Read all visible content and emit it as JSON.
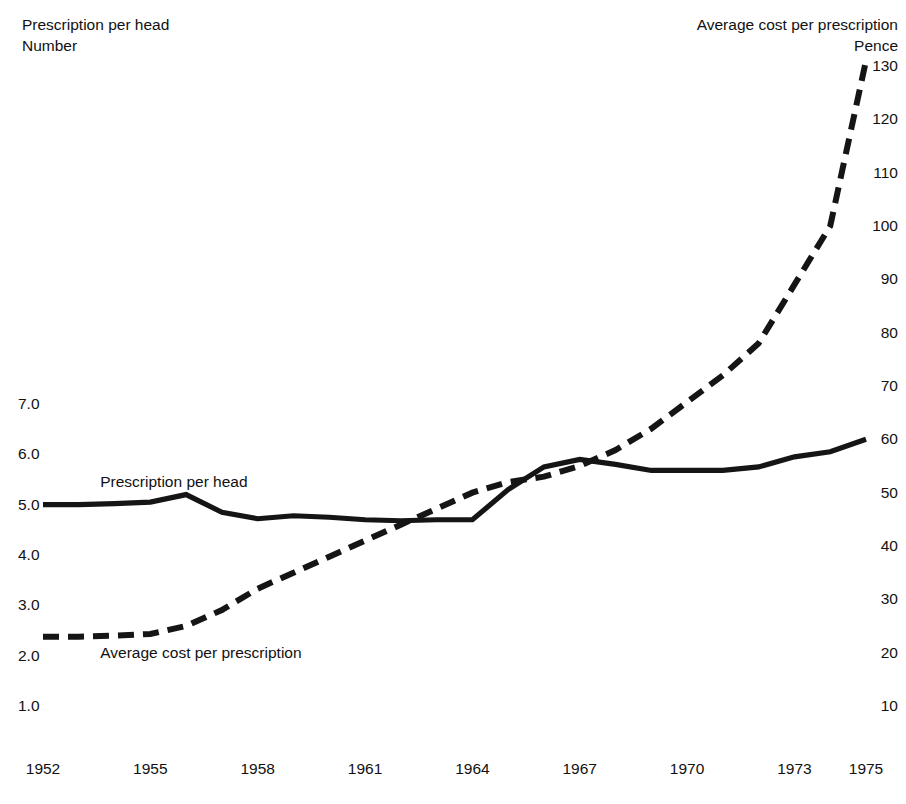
{
  "header": {
    "left_line1": "Prescription per head",
    "left_line2": "Number",
    "right_line1": "Average cost per prescription",
    "right_line2": "Pence"
  },
  "series_labels": {
    "solid": "Prescription per head",
    "dashed": "Average cost per prescription"
  },
  "axes": {
    "left_ticks": [
      "7.0",
      "6.0",
      "5.0",
      "4.0",
      "3.0",
      "2.0",
      "1.0"
    ],
    "right_ticks": [
      "130",
      "120",
      "110",
      "100",
      "90",
      "80",
      "70",
      "60",
      "50",
      "40",
      "30",
      "20",
      "10"
    ],
    "x_ticks": [
      "1952",
      "1955",
      "1958",
      "1961",
      "1964",
      "1967",
      "1970",
      "1973",
      "1975"
    ]
  },
  "colors": {
    "line": "#151515",
    "text": "#111111",
    "background": "#ffffff"
  },
  "chart_data": {
    "type": "line",
    "title": "",
    "xlabel": "",
    "ylabel": "Number",
    "y2label": "Pence",
    "grid": false,
    "legend": "inline-annotation",
    "x": [
      1952,
      1953,
      1954,
      1955,
      1956,
      1957,
      1958,
      1959,
      1960,
      1961,
      1962,
      1963,
      1964,
      1965,
      1966,
      1967,
      1968,
      1969,
      1970,
      1971,
      1972,
      1973,
      1974,
      1975
    ],
    "xlim": [
      1952,
      1975
    ],
    "ylim": [
      1.0,
      7.0
    ],
    "y2lim": [
      10,
      130
    ],
    "series": [
      {
        "name": "Prescription per head",
        "style": "solid",
        "axis": "left",
        "unit": "Number",
        "values": [
          5.0,
          5.0,
          5.02,
          5.05,
          5.2,
          4.85,
          4.72,
          4.78,
          4.75,
          4.7,
          4.68,
          4.7,
          4.7,
          5.3,
          5.75,
          5.9,
          5.8,
          5.68,
          5.68,
          5.68,
          5.75,
          5.95,
          6.05,
          6.3
        ]
      },
      {
        "name": "Average cost per prescription",
        "style": "dashed",
        "axis": "right",
        "unit": "Pence",
        "values": [
          23,
          23,
          23.2,
          23.5,
          25,
          28,
          32,
          35,
          38,
          41,
          44,
          47,
          50,
          52,
          53,
          55,
          58,
          62,
          67,
          72,
          78,
          89,
          100,
          131
        ]
      }
    ],
    "annotations": [
      {
        "text": "Prescription per head",
        "x": 1953.6,
        "y": 5.45
      },
      {
        "text": "Average cost per prescription",
        "x": 1953.6,
        "y": 2.05
      }
    ]
  }
}
